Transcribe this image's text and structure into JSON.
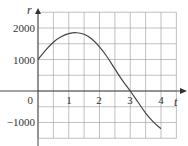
{
  "chart_data": {
    "type": "line",
    "title": "",
    "xlabel": "t",
    "ylabel": "r",
    "x_ticks": [
      "0",
      "1",
      "2",
      "3",
      "4"
    ],
    "y_ticks": [
      "2000",
      "1000",
      "-1000"
    ],
    "xlim": [
      0,
      4.5
    ],
    "ylim": [
      -1500,
      2500
    ],
    "grid": true,
    "grid_x_step": 0.5,
    "grid_y_step": 500,
    "series": [
      {
        "name": "r(t)",
        "x": [
          0,
          0.25,
          0.5,
          0.75,
          1.0,
          1.25,
          1.5,
          1.75,
          2.0,
          2.25,
          2.5,
          2.75,
          3.0,
          3.25,
          3.5,
          3.75,
          4.0
        ],
        "values": [
          1000,
          1300,
          1550,
          1720,
          1820,
          1850,
          1800,
          1650,
          1400,
          1080,
          700,
          330,
          0,
          -350,
          -700,
          -980,
          -1200
        ]
      }
    ]
  },
  "labels": {
    "y_axis": "r",
    "x_axis": "t",
    "y2000": "2000",
    "y1000": "1000",
    "y0": "0",
    "yneg1000": "−1000",
    "x1": "1",
    "x2": "2",
    "x3": "3",
    "x4": "4"
  },
  "colors": {
    "grid": "#999999",
    "axis": "#444444",
    "curve": "#444444"
  }
}
